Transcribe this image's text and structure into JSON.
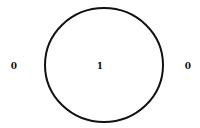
{
  "diagram": {
    "type": "venn",
    "sets": 1,
    "circle": {
      "cx": 104,
      "cy": 65,
      "rx": 59,
      "ry": 57,
      "stroke": "#111111",
      "stroke_width": 2
    },
    "labels": [
      {
        "id": "outside-left",
        "text": "0",
        "x": 14,
        "y": 66
      },
      {
        "id": "inside",
        "text": "1",
        "x": 100,
        "y": 66
      },
      {
        "id": "outside-right",
        "text": "0",
        "x": 188,
        "y": 66
      }
    ]
  }
}
